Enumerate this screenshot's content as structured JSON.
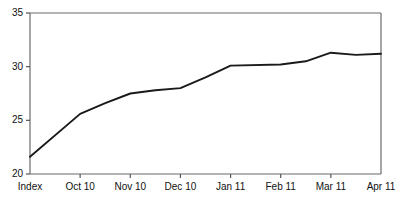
{
  "chart_data": {
    "type": "line",
    "title": "",
    "subtitle": "",
    "xlabel": "",
    "ylabel": "",
    "categories": [
      "Index",
      "Oct 10",
      "Nov 10",
      "Dec 10",
      "Jan 11",
      "Feb 11",
      "Mar 11",
      "Apr 11"
    ],
    "values": [
      21.6,
      25.6,
      27.5,
      28.0,
      30.1,
      30.2,
      31.3,
      31.2
    ],
    "series": [
      {
        "name": "Index series",
        "points": [
          {
            "x": "Index",
            "x_frac": 0.0,
            "y": 21.6
          },
          {
            "x": "Oct 10",
            "x_frac": 1.0,
            "y": 25.6
          },
          {
            "x": "mid",
            "x_frac": 1.5,
            "y": 26.6
          },
          {
            "x": "Nov 10",
            "x_frac": 2.0,
            "y": 27.5
          },
          {
            "x": "mid",
            "x_frac": 2.5,
            "y": 27.8
          },
          {
            "x": "Dec 10",
            "x_frac": 3.0,
            "y": 28.0
          },
          {
            "x": "mid",
            "x_frac": 3.5,
            "y": 29.0
          },
          {
            "x": "Jan 11",
            "x_frac": 4.0,
            "y": 30.1
          },
          {
            "x": "Feb 11",
            "x_frac": 5.0,
            "y": 30.2
          },
          {
            "x": "mid",
            "x_frac": 5.5,
            "y": 30.5
          },
          {
            "x": "Mar 11",
            "x_frac": 6.0,
            "y": 31.3
          },
          {
            "x": "mid",
            "x_frac": 6.5,
            "y": 31.1
          },
          {
            "x": "Apr 11",
            "x_frac": 7.0,
            "y": 31.2
          }
        ]
      }
    ],
    "ylim": [
      20,
      35
    ],
    "yticks": [
      20,
      25,
      30,
      35
    ],
    "ytick_labels": [
      "20",
      "25",
      "30",
      "35"
    ],
    "xtick_labels": [
      "Index",
      "Oct 10",
      "Nov 10",
      "Dec 10",
      "Jan 11",
      "Feb 11",
      "Mar 11",
      "Apr 11"
    ],
    "grid": false,
    "legend": false,
    "legend_position": "none",
    "line_color": "#1a1a1a",
    "axis_color": "#555555",
    "background_color": "#ffffff",
    "annotations": []
  },
  "axis": {
    "y_labels": [
      "35",
      "30",
      "25",
      "20"
    ],
    "x_labels": [
      "Index",
      "Oct 10",
      "Nov 10",
      "Dec 10",
      "Jan 11",
      "Feb 11",
      "Mar 11",
      "Apr 11"
    ]
  }
}
